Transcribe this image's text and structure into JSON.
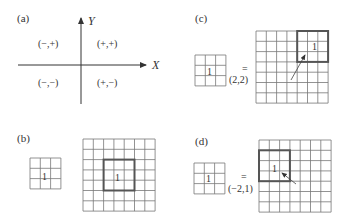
{
  "panels": {
    "a": {
      "label": "(a)",
      "x_axis_label": "X",
      "y_axis_label": "Y",
      "quadrants": {
        "top_left": "(−,+)",
        "top_right": "(+,+)",
        "bottom_left": "(−,−)",
        "bottom_right": "(+,−)"
      }
    },
    "b": {
      "label": "(b)",
      "kernel_value": "1",
      "kernel_size": 3,
      "image_size": 7,
      "highlight_value": "1",
      "highlight_col": 2,
      "highlight_row": 2
    },
    "c": {
      "label": "(c)",
      "kernel_value": "1",
      "equals": "=",
      "offset": "(2,2)",
      "highlight_value": "1",
      "highlight_col": 4,
      "highlight_row": 0
    },
    "d": {
      "label": "(d)",
      "kernel_value": "1",
      "equals": "=",
      "offset": "(−2,1)",
      "highlight_value": "1",
      "highlight_col": 0,
      "highlight_row": 1
    }
  },
  "colors": {
    "grid": "#777777",
    "highlight": "#555555",
    "text": "#333333"
  }
}
